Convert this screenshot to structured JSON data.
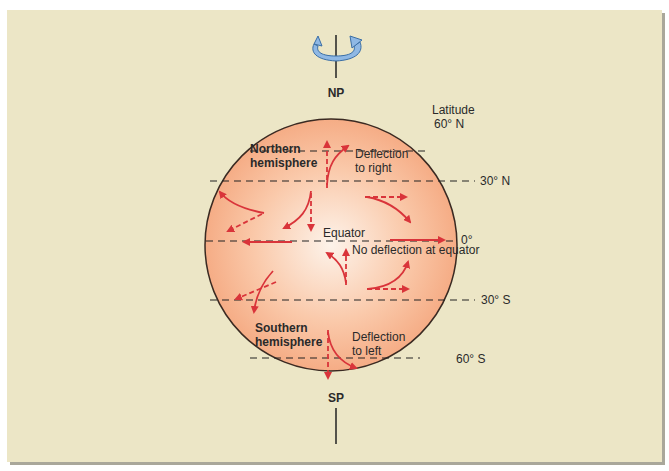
{
  "diagram": {
    "poles": {
      "north": "NP",
      "south": "SP"
    },
    "latitude_header": "Latitude",
    "latitudes": [
      "60° N",
      "30° N",
      "0°",
      "30° S",
      "60° S"
    ],
    "equator_label": "Equator",
    "no_deflection_label": "No deflection at equator",
    "northern": {
      "title_line1": "Northern",
      "title_line2": "hemisphere",
      "deflect_line1": "Deflection",
      "deflect_line2": "to right"
    },
    "southern": {
      "title_line1": "Southern",
      "title_line2": "hemisphere",
      "deflect_line1": "Deflection",
      "deflect_line2": "to left"
    },
    "colors": {
      "background": "#ece6c6",
      "sphere_edge": "#f7b795",
      "sphere_center": "#fdf0e6",
      "arrow": "#d9343a",
      "rotation_arrow": "#8fb8e4"
    }
  }
}
